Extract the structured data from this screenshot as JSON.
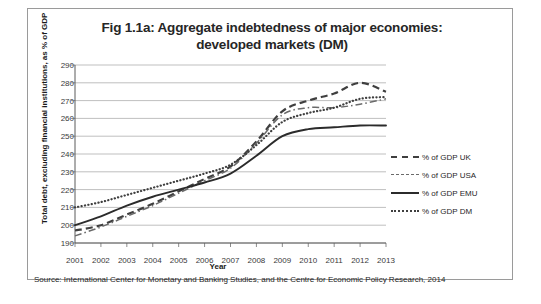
{
  "figure": {
    "title_line1": "Fig 1.1a: Aggregate indebtedness of major economies:",
    "title_line2": "developed markets (DM)",
    "source": "Source: International Center for Monetary and Banking Studies, and the Centre for Economic Policy Research, 2014"
  },
  "chart_data": {
    "type": "line",
    "title": "Fig 1.1a: Aggregate indebtedness of major economies: developed markets (DM)",
    "xlabel": "Year",
    "ylabel": "Total debt, excluding financial institutions, as % of GDP",
    "x": [
      2001,
      2002,
      2003,
      2004,
      2005,
      2006,
      2007,
      2008,
      2009,
      2010,
      2011,
      2012,
      2013
    ],
    "xtick_labels": [
      "2001",
      "2002",
      "2003",
      "2004",
      "2005",
      "2006",
      "2007",
      "2008",
      "2009",
      "2010",
      "2011",
      "2012",
      "2013"
    ],
    "ytick_labels": [
      "290",
      "280",
      "270",
      "260",
      "250",
      "240",
      "230",
      "220",
      "210",
      "200",
      "190"
    ],
    "ylim": [
      190,
      290
    ],
    "ytick_step": 10,
    "grid": true,
    "grid_axis": "y",
    "legend_position": "right",
    "series": [
      {
        "name": "% of GDP UK",
        "style": "dashed",
        "color": "#3f3f3f",
        "values": [
          197,
          200,
          206,
          212,
          219,
          226,
          233,
          247,
          264,
          270,
          274,
          280,
          275
        ]
      },
      {
        "name": "% of GDP USA",
        "style": "dash-dot",
        "color": "#6a6a6a",
        "values": [
          194,
          199,
          205,
          211,
          218,
          225,
          232,
          246,
          262,
          266,
          266,
          268,
          271
        ]
      },
      {
        "name": "% of GDP EMU",
        "style": "solid",
        "color": "#2b2b2b",
        "values": [
          200,
          205,
          211,
          216,
          220,
          224,
          229,
          239,
          250,
          254,
          255,
          256,
          256
        ]
      },
      {
        "name": "% of GDP DM",
        "style": "dotted",
        "color": "#3f3f3f",
        "values": [
          210,
          213,
          217,
          221,
          225,
          229,
          234,
          245,
          258,
          263,
          266,
          271,
          272
        ]
      }
    ]
  }
}
